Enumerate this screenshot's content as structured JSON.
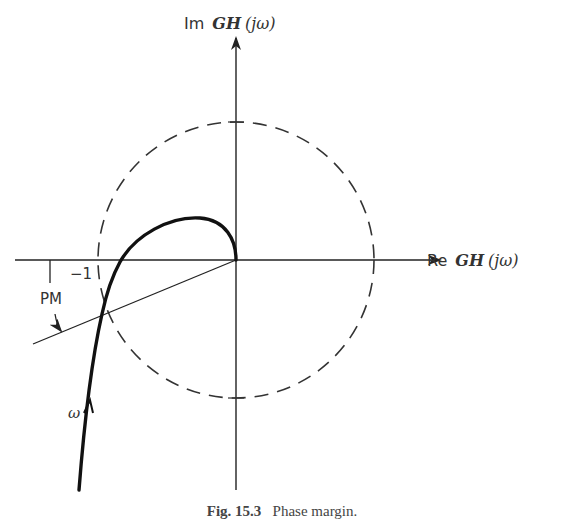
{
  "figure": {
    "axes": {
      "imag_label_prefix": "Im",
      "imag_label_func": "GH",
      "imag_label_arg": "(jω)",
      "real_label_prefix": "Re",
      "real_label_func": "GH",
      "real_label_arg": "(jω)"
    },
    "annotations": {
      "minus_one": "−1",
      "phase_margin": "PM",
      "omega": "ω"
    },
    "unit_circle": {
      "style": "dashed",
      "radius_units": 1
    },
    "caption": {
      "label": "Fig. 15.3",
      "text": "Phase margin."
    }
  },
  "colors": {
    "ink": "#222222",
    "background": "#ffffff"
  }
}
